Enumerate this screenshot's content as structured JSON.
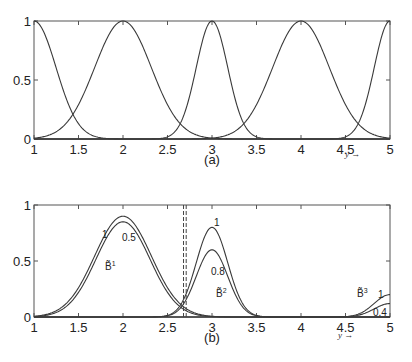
{
  "chart_data": [
    {
      "id": "a",
      "type": "line",
      "caption": "(a)",
      "xlabel": "y →",
      "ylabel": "",
      "xlim": [
        1,
        5
      ],
      "ylim": [
        0,
        1
      ],
      "xticks": [
        "1",
        "1.5",
        "2",
        "2.5",
        "3",
        "3.5",
        "4",
        "4.5",
        "5"
      ],
      "yticks": [
        "0",
        "0.5",
        "1"
      ],
      "grid": false,
      "series": [
        {
          "name": "MF centered at 1",
          "center": 1,
          "width": 0.35
        },
        {
          "name": "MF centered at 2",
          "center": 2,
          "width": 0.45
        },
        {
          "name": "MF centered at 3",
          "center": 3,
          "width": 0.25
        },
        {
          "name": "MF centered at 4",
          "center": 4,
          "width": 0.45
        },
        {
          "name": "MF centered at 5",
          "center": 5,
          "width": 0.25
        }
      ]
    },
    {
      "id": "b",
      "type": "line",
      "caption": "(b)",
      "xlabel": "y →",
      "ylabel": "",
      "xlim": [
        1,
        5
      ],
      "ylim": [
        0,
        1
      ],
      "xticks": [
        "1",
        "1.5",
        "2",
        "2.5",
        "3",
        "3.5",
        "4",
        "4.5",
        "5"
      ],
      "yticks": [
        "0",
        "0.5",
        "1"
      ],
      "grid": false,
      "dashed_vlines": [
        2.68,
        2.71
      ],
      "series": [
        {
          "name": "B1 (1)",
          "center": 2,
          "width": 0.45,
          "peak": 0.9,
          "label": "1"
        },
        {
          "name": "B1 (0.5)",
          "center": 2,
          "width": 0.43,
          "peak": 0.85,
          "label": "0.5"
        },
        {
          "name": "B2 (1)",
          "center": 3,
          "width": 0.25,
          "peak": 0.8,
          "label": "1"
        },
        {
          "name": "B2 (0.8)",
          "center": 3,
          "width": 0.25,
          "peak": 0.6,
          "label": "0.8"
        },
        {
          "name": "B3 (1)",
          "center": 5,
          "width": 0.25,
          "peak": 0.2,
          "label": "1"
        },
        {
          "name": "B3 (0.4)",
          "center": 5,
          "width": 0.25,
          "peak": 0.12,
          "label": "0.4"
        }
      ],
      "annotations": [
        "B̃¹",
        "B̃²",
        "B̃³",
        "1",
        "0.5",
        "1",
        "0.8",
        "1",
        "0.4"
      ]
    }
  ],
  "labels": {
    "caption_a": "(a)",
    "caption_b": "(b)",
    "yarrow": "y →",
    "xticks": [
      "1",
      "1.5",
      "2",
      "2.5",
      "3",
      "3.5",
      "4",
      "4.5",
      "5"
    ],
    "yticks": [
      "0",
      "0.5",
      "1"
    ],
    "b1": "B̃",
    "b1_sup": "1",
    "b2": "B̃",
    "b2_sup": "2",
    "b3": "B̃",
    "b3_sup": "3",
    "b1_hi": "1",
    "b1_lo": "0.5",
    "b2_hi": "1",
    "b2_lo": "0.8",
    "b3_hi": "1",
    "b3_lo": "0.4"
  }
}
